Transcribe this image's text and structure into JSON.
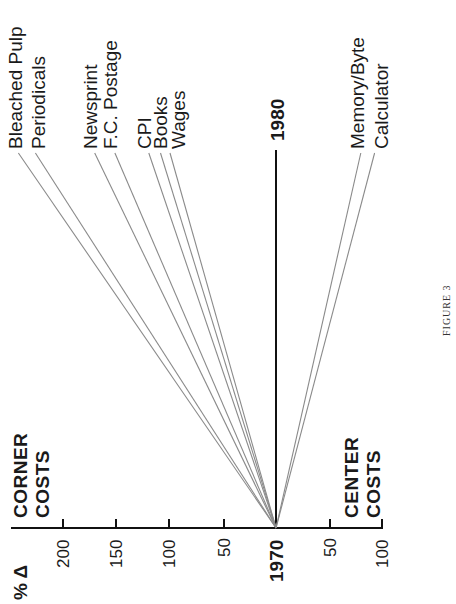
{
  "chart_data": {
    "type": "line",
    "title": "",
    "caption": "FIGURE 3",
    "orientation": "rotated -90deg (years on vertical axis, % change on horizontal axis)",
    "xlabel": "% Δ",
    "ylabel": "",
    "x_start_label": "1970",
    "x_end_label": "1980",
    "axis_ticks": {
      "corner_side": [
        "200",
        "150",
        "100",
        "50"
      ],
      "origin": "1970",
      "center_side": [
        "50",
        "100"
      ]
    },
    "category_labels": {
      "positive": [
        "CORNER",
        "COSTS"
      ],
      "negative": [
        "CENTER",
        "COSTS"
      ]
    },
    "xlim": [
      -100,
      250
    ],
    "series": [
      {
        "name": "Bleached Pulp",
        "values": [
          0,
          243
        ]
      },
      {
        "name": "Periodicals",
        "values": [
          0,
          227
        ]
      },
      {
        "name": "Newsprint",
        "values": [
          0,
          171
        ]
      },
      {
        "name": "F.C. Postage",
        "values": [
          0,
          152
        ]
      },
      {
        "name": "CPI",
        "values": [
          0,
          120
        ]
      },
      {
        "name": "Books",
        "values": [
          0,
          109
        ]
      },
      {
        "name": "Wages",
        "values": [
          0,
          100
        ]
      },
      {
        "name": "Memory/Byte",
        "values": [
          0,
          -80
        ]
      },
      {
        "name": "Calculator",
        "values": [
          0,
          -93
        ]
      }
    ],
    "years": [
      "1970",
      "1980"
    ],
    "grid": false,
    "legend": "direct labels at line ends"
  },
  "labels": {
    "pct_delta": "% Δ",
    "year_start": "1970",
    "year_end": "1980",
    "corner_1": "CORNER",
    "corner_2": "COSTS",
    "center_1": "CENTER",
    "center_2": "COSTS",
    "figure": "FIGURE 3",
    "ticks": {
      "t200": "200",
      "t150": "150",
      "t100": "100",
      "t50": "50",
      "c50": "50",
      "c100": "100"
    },
    "series": [
      "Bleached Pulp",
      "Periodicals",
      "Newsprint",
      "F.C. Postage",
      "CPI",
      "Books",
      "Wages",
      "Memory/Byte",
      "Calculator"
    ]
  },
  "colors": {
    "line": "#8a8a8a",
    "axis": "#111111",
    "text": "#1a1a1a"
  }
}
